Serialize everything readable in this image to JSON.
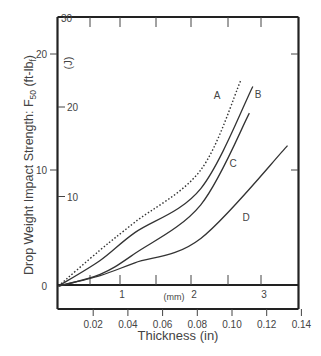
{
  "chart_data": {
    "type": "line",
    "title": "",
    "xlabel": "Thickness  (in)",
    "xlabel_secondary": "(mm)",
    "ylabel": "Drop Weight Impact Strength: F50 (ft-lbf)",
    "ylabel_secondary": "(J)",
    "xlim": [
      0,
      0.14
    ],
    "ylim": [
      0,
      23
    ],
    "x_ticks": [
      "0.02",
      "0.04",
      "0.06",
      "0.08",
      "0.10",
      "0.12",
      "0.14"
    ],
    "x_tick_values": [
      0.02,
      0.04,
      0.06,
      0.08,
      0.1,
      0.12,
      0.14
    ],
    "x_secondary_ticks": [
      "1",
      "2",
      "3"
    ],
    "x_secondary_tick_values_mm": [
      1,
      2,
      3
    ],
    "y_ticks": [
      "0",
      "10",
      "20"
    ],
    "y_tick_values": [
      0,
      10,
      20
    ],
    "y_secondary_ticks": [
      "10",
      "20",
      "30"
    ],
    "y_secondary_tick_values_J": [
      10,
      20,
      30
    ],
    "grid": false,
    "legend": "inline curve labels",
    "series": [
      {
        "name": "A",
        "style": "dotted",
        "x": [
          0,
          0.024,
          0.044,
          0.082,
          0.105
        ],
        "values": [
          0,
          3.1,
          5.5,
          10.0,
          17.7
        ]
      },
      {
        "name": "B",
        "style": "solid",
        "x": [
          0,
          0.024,
          0.044,
          0.082,
          0.112
        ],
        "values": [
          0,
          2.2,
          4.6,
          8.4,
          17.2
        ]
      },
      {
        "name": "C",
        "style": "solid",
        "x": [
          0,
          0.024,
          0.044,
          0.082,
          0.11
        ],
        "values": [
          0,
          1.0,
          2.8,
          7.0,
          14.9
        ]
      },
      {
        "name": "D",
        "style": "solid",
        "x": [
          0,
          0.024,
          0.044,
          0.082,
          0.132
        ],
        "values": [
          0,
          0.9,
          2.0,
          4.1,
          12.1
        ]
      }
    ],
    "annotations": [
      {
        "text": "A",
        "x_px": 217,
        "y_px": 99
      },
      {
        "text": "B",
        "x_px": 258,
        "y_px": 98
      },
      {
        "text": "C",
        "x_px": 233,
        "y_px": 167
      },
      {
        "text": "D",
        "x_px": 246,
        "y_px": 221
      }
    ]
  },
  "labels": {
    "xlabel": "Thickness  (in)",
    "mm": "(mm)",
    "ylabel_main": "Drop Weight Impact Strength: F",
    "ylabel_sub": "50",
    "ylabel_unit": " (ft-lb",
    "ylabel_unit_sub": "f",
    "ylabel_close": ")",
    "j_unit": "(J)",
    "zero": "0"
  }
}
